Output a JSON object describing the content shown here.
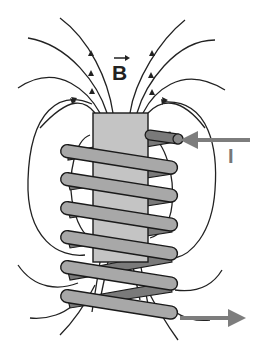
{
  "figure": {
    "labels": {
      "field": "B",
      "current": "I"
    },
    "colors": {
      "field_lines": "#222222",
      "core": "#c4c4c4",
      "coil_front": "#a8a8a8",
      "coil_back": "#7a7a7a",
      "current_arrow": "#7d7d7d",
      "background": "#ffffff"
    },
    "components": [
      {
        "name": "core",
        "description": "rectangular core inside coil"
      },
      {
        "name": "coil",
        "turns_front": 6,
        "description": "helical wire wound around core"
      },
      {
        "name": "field-lines",
        "description": "magnetic field lines emerging from top, looping around sides, entering at bottom"
      },
      {
        "name": "current-in-arrow",
        "description": "arrow pointing left into top of coil"
      },
      {
        "name": "current-out-arrow",
        "description": "arrow pointing right out of bottom of coil"
      }
    ]
  }
}
